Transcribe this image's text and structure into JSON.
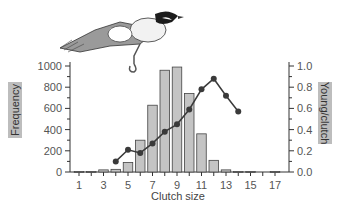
{
  "chart_data": {
    "type": "bar",
    "title": "",
    "xlabel": "Clutch size",
    "ylabel": "Frequency",
    "y2label": "Young/clutch",
    "categories": [
      1,
      2,
      3,
      4,
      5,
      6,
      7,
      8,
      9,
      10,
      11,
      12,
      13,
      14,
      15,
      16,
      17
    ],
    "x_tick_labels": [
      "1",
      "3",
      "5",
      "7",
      "9",
      "11",
      "13",
      "15",
      "17"
    ],
    "y_tick_labels": [
      "0",
      "200",
      "400",
      "600",
      "800",
      "1000"
    ],
    "y2_tick_labels": [
      "0.0",
      "0.2",
      "0.4",
      "0.6",
      "0.8",
      "1.0"
    ],
    "ylim": [
      0,
      1000
    ],
    "y2lim": [
      0,
      1.0
    ],
    "grid": false,
    "legend": "none",
    "series": [
      {
        "name": "Frequency",
        "type": "bar",
        "axis": "left",
        "color": "#c4c4c4",
        "values": [
          5,
          5,
          20,
          25,
          90,
          300,
          630,
          960,
          990,
          740,
          360,
          110,
          20,
          5,
          5,
          0,
          5
        ]
      },
      {
        "name": "Young/clutch",
        "type": "line",
        "axis": "right",
        "color": "#3a3a3a",
        "x": [
          4,
          5,
          6,
          7,
          8,
          9,
          10,
          11,
          12,
          13,
          14
        ],
        "values": [
          0.1,
          0.21,
          0.18,
          0.27,
          0.38,
          0.45,
          0.59,
          0.78,
          0.88,
          0.72,
          0.57
        ]
      }
    ],
    "annotations": [
      "bird illustration (great tit) above the plot"
    ]
  }
}
